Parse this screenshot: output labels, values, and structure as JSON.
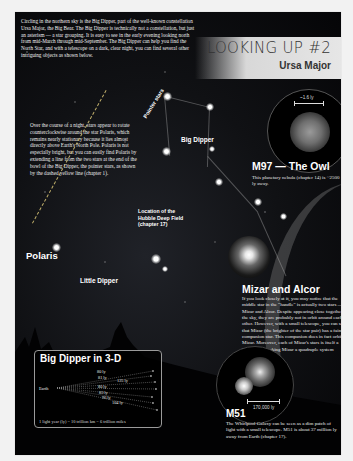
{
  "header": {
    "title": "LOOKING UP #2",
    "subtitle": "Ursa Major"
  },
  "intro": {
    "text": "Circling in the northern sky is the Big Dipper, part of the well-known constellation Ursa Major, the Big Bear. The Big Dipper is technically not a constellation, but just an asterism — a star grouping. It is easy to see in the early evening looking north from mid-March through mid-September. The Big Dipper can help you find the North Star, and with a telescope on a dark, clear night, you can find several other intriguing objects as shown below."
  },
  "polaris_note": {
    "text": "Over the course of a night, stars appear to rotate counterclockwise around the star Polaris, which remains nearly stationary because it lies almost directly above Earth's North Pole. Polaris is not especially bright, but you can easily find Polaris by extending a line from the two stars at the end of the bowl of the Big Dipper, the pointer stars, as shown by the dashed yellow line (chapter 1)."
  },
  "labels": {
    "pointer_stars": "Pointer stars",
    "big_dipper": "Big Dipper",
    "polaris": "Polaris",
    "little_dipper": "Little Dipper",
    "hubble": "Location of the Hubble Deep Field (chapter 17)"
  },
  "m97": {
    "title": "M97 — The Owl",
    "description": "This planetary nebula (chapter 14) is ~2500 ly away.",
    "scale": "~1.6 ly"
  },
  "mizar": {
    "title": "Mizar and Alcor",
    "description": "If you look closely at it, you may notice that the middle star in the \"handle\" is actually two stars — Mizar and Alcor. Despite appearing close together in the sky, they are probably not in orbit around each other. However, with a small telescope, you can see that Mizar (the brighter of the star pair) has a faint companion star. This companion does in fact orbit Mizar. Moreover, each of Mizar's stars is itself a binary star, making Mizar a quadruple system (chapter 13)."
  },
  "inset_3d": {
    "title": "Big Dipper in 3-D",
    "origin": "Earth",
    "distances": [
      "80 ly",
      "81 ly",
      "125 ly",
      "80 ly",
      "83 ly",
      "96 ly",
      "104 ly"
    ],
    "footnote": "1 light year (ly) = 10 trillion km = 6 trillion miles"
  },
  "m51": {
    "title": "M51",
    "description": "The Whirlpool Galaxy can be seen as a dim patch of light with a small telescope. M51 is about 37 million ly away from Earth (chapter 17).",
    "scale": "170,000 ly"
  },
  "colors": {
    "background": "#050507",
    "banner": "#e0e0e0",
    "pointer_line": "#bfae6a",
    "text": "#ffffff"
  }
}
